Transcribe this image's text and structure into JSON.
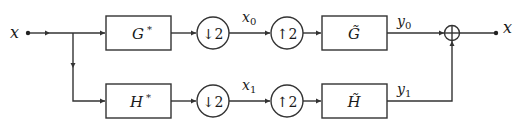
{
  "diagram": {
    "input": {
      "label": "x"
    },
    "output": {
      "label": "x"
    },
    "branches": [
      {
        "analysis_filter": {
          "symbol": "G",
          "superscript": "*"
        },
        "downsampler": {
          "label": "↓2"
        },
        "subband_signal": {
          "symbol": "x",
          "subscript": "0"
        },
        "upsampler": {
          "label": "↑2"
        },
        "synthesis_filter": {
          "symbol": "G̃"
        },
        "branch_output": {
          "symbol": "y",
          "subscript": "0"
        }
      },
      {
        "analysis_filter": {
          "symbol": "H",
          "superscript": "*"
        },
        "downsampler": {
          "label": "↓2"
        },
        "subband_signal": {
          "symbol": "x",
          "subscript": "1"
        },
        "upsampler": {
          "label": "↑2"
        },
        "synthesis_filter": {
          "symbol": "H̃"
        },
        "branch_output": {
          "symbol": "y",
          "subscript": "1"
        }
      }
    ],
    "summer": {
      "symbol": "⊕"
    }
  },
  "colors": {
    "stroke": "#333333",
    "text": "#1a1a1a",
    "background": "#ffffff"
  }
}
